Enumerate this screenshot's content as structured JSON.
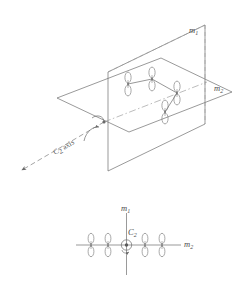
{
  "figure": {
    "top_panel": {
      "name": "perspective-view",
      "plane_labels": {
        "vertical_plane": "m",
        "vertical_plane_sub": "1",
        "horizontal_plane": "m",
        "horizontal_plane_sub": "2"
      },
      "axis_label": {
        "symbol": "C",
        "sub": "2",
        "text": "axis",
        "full": "C2 axis"
      },
      "orbitals": [
        {
          "id": "p-orbital-1",
          "cx": 128,
          "cy": 84
        },
        {
          "id": "p-orbital-2",
          "cx": 152,
          "cy": 79
        },
        {
          "id": "p-orbital-3",
          "cx": 177,
          "cy": 93
        },
        {
          "id": "p-orbital-4",
          "cx": 165,
          "cy": 112
        }
      ]
    },
    "bottom_panel": {
      "name": "end-on-projection",
      "vertical_axis_label": "m",
      "vertical_axis_sub": "1",
      "horizontal_axis_label": "m",
      "horizontal_axis_sub": "2",
      "center_label": "C",
      "center_label_sub": "2",
      "orbitals": [
        {
          "id": "p-orbital-1",
          "cx": 91
        },
        {
          "id": "p-orbital-2",
          "cx": 108
        },
        {
          "id": "p-orbital-3",
          "cx": 145
        },
        {
          "id": "p-orbital-4",
          "cx": 162
        }
      ]
    },
    "colors": {
      "line": "#6a6a6a",
      "dashed": "#8e8e8e",
      "orbital": "#7a7a7a",
      "text": "#4a4a4a",
      "background": "#ffffff"
    }
  }
}
